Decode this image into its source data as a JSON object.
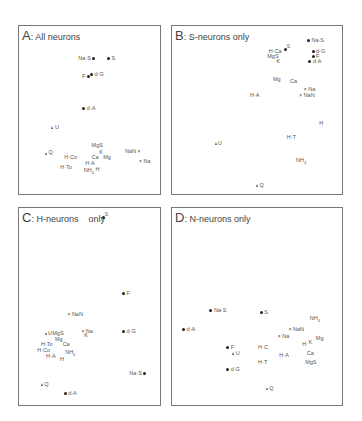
{
  "chart_data": [
    {
      "type": "scatter",
      "title": "A: All neurons",
      "letter": "A",
      "subtitle": "All neurons",
      "grid": false,
      "markers": {
        "filled_circle": "dot",
        "open_circle": "circle",
        "cross": "x",
        "triangle": "tri"
      },
      "points": [
        {
          "label": "Na·S",
          "x": 0.53,
          "y": 0.12,
          "marker": "dot",
          "lp": "left"
        },
        {
          "label": "S",
          "x": 0.65,
          "y": 0.12,
          "marker": "dot",
          "lp": "right"
        },
        {
          "label": "F",
          "x": 0.49,
          "y": 0.24,
          "marker": "dot",
          "lp": "left"
        },
        {
          "label": "d·G",
          "x": 0.52,
          "y": 0.23,
          "marker": "dot",
          "lp": "right"
        },
        {
          "label": "d·A",
          "x": 0.46,
          "y": 0.46,
          "marker": "dot",
          "lp": "right"
        },
        {
          "label": "U",
          "x": 0.22,
          "y": 0.59,
          "marker": "tri",
          "lp": "right"
        },
        {
          "label": "Q",
          "x": 0.17,
          "y": 0.76,
          "marker": "tri",
          "lp": "right"
        },
        {
          "label": "MgS",
          "x": 0.52,
          "y": 0.71,
          "marker": "circle",
          "lp": "right"
        },
        {
          "label": "K",
          "x": 0.58,
          "y": 0.76,
          "marker": "circle",
          "lp": "right"
        },
        {
          "label": "Ca",
          "x": 0.52,
          "y": 0.79,
          "marker": "circle",
          "lp": "right"
        },
        {
          "label": "Mg",
          "x": 0.61,
          "y": 0.79,
          "marker": "circle",
          "lp": "right"
        },
        {
          "label": "H·Co",
          "x": 0.4,
          "y": 0.79,
          "marker": "circle",
          "lp": "left"
        },
        {
          "label": "H·A",
          "x": 0.47,
          "y": 0.83,
          "marker": "circle",
          "lp": "right"
        },
        {
          "label": "H·To",
          "x": 0.36,
          "y": 0.86,
          "marker": "circle",
          "lp": "left"
        },
        {
          "label": "NH4",
          "x": 0.46,
          "y": 0.88,
          "marker": "circle",
          "lp": "right"
        },
        {
          "label": "H",
          "x": 0.55,
          "y": 0.87,
          "marker": "circle",
          "lp": "right"
        },
        {
          "label": "NaN",
          "x": 0.88,
          "y": 0.75,
          "marker": "x",
          "lp": "left"
        },
        {
          "label": "Na",
          "x": 0.9,
          "y": 0.82,
          "marker": "x",
          "lp": "right"
        }
      ]
    },
    {
      "type": "scatter",
      "title": "B: S-neurons only",
      "letter": "B",
      "subtitle": "S-neurons only",
      "grid": false,
      "points": [
        {
          "label": "Na·S",
          "x": 0.85,
          "y": 0.04,
          "marker": "dot",
          "lp": "right"
        },
        {
          "label": "S",
          "x": 0.7,
          "y": 0.08,
          "marker": "dot",
          "lp": "above"
        },
        {
          "label": "H·Ca",
          "x": 0.67,
          "y": 0.11,
          "marker": "circle",
          "lp": "left"
        },
        {
          "label": "d·G",
          "x": 0.88,
          "y": 0.11,
          "marker": "dot",
          "lp": "right"
        },
        {
          "label": "MgS",
          "x": 0.65,
          "y": 0.14,
          "marker": "circle",
          "lp": "left"
        },
        {
          "label": "F",
          "x": 0.88,
          "y": 0.14,
          "marker": "dot",
          "lp": "right"
        },
        {
          "label": "d·A",
          "x": 0.86,
          "y": 0.17,
          "marker": "dot",
          "lp": "right"
        },
        {
          "label": "K",
          "x": 0.66,
          "y": 0.17,
          "marker": "circle",
          "lp": "left"
        },
        {
          "label": "Mg",
          "x": 0.62,
          "y": 0.29,
          "marker": "circle",
          "lp": "right"
        },
        {
          "label": "Ca",
          "x": 0.73,
          "y": 0.3,
          "marker": "circle",
          "lp": "right"
        },
        {
          "label": "Na",
          "x": 0.83,
          "y": 0.35,
          "marker": "x",
          "lp": "right"
        },
        {
          "label": "NaN",
          "x": 0.8,
          "y": 0.39,
          "marker": "x",
          "lp": "right"
        },
        {
          "label": "H·A",
          "x": 0.47,
          "y": 0.39,
          "marker": "circle",
          "lp": "right"
        },
        {
          "label": "H",
          "x": 0.92,
          "y": 0.57,
          "marker": "circle",
          "lp": "right"
        },
        {
          "label": "H·T",
          "x": 0.71,
          "y": 0.66,
          "marker": "circle",
          "lp": "right"
        },
        {
          "label": "U",
          "x": 0.25,
          "y": 0.7,
          "marker": "tri",
          "lp": "right"
        },
        {
          "label": "NH4",
          "x": 0.77,
          "y": 0.81,
          "marker": "circle",
          "lp": "right"
        },
        {
          "label": "Q",
          "x": 0.52,
          "y": 0.97,
          "marker": "tri",
          "lp": "right"
        }
      ]
    },
    {
      "type": "scatter",
      "title": "C: H-neurons only",
      "letter": "C",
      "subtitle": "H-neurons",
      "subtitle_tail": "only",
      "grid": false,
      "points": [
        {
          "label": "S",
          "x": 0.62,
          "y": 0.02,
          "marker": "dot",
          "lp": "above"
        },
        {
          "label": "F",
          "x": 0.78,
          "y": 0.44,
          "marker": "dot",
          "lp": "right"
        },
        {
          "label": "NaN",
          "x": 0.35,
          "y": 0.55,
          "marker": "x",
          "lp": "right"
        },
        {
          "label": "d·G",
          "x": 0.78,
          "y": 0.64,
          "marker": "dot",
          "lp": "right"
        },
        {
          "label": "U",
          "x": 0.17,
          "y": 0.65,
          "marker": "tri",
          "lp": "right"
        },
        {
          "label": "MgS",
          "x": 0.3,
          "y": 0.65,
          "marker": "circle",
          "lp": "left"
        },
        {
          "label": "Na",
          "x": 0.46,
          "y": 0.64,
          "marker": "x",
          "lp": "right"
        },
        {
          "label": "K",
          "x": 0.47,
          "y": 0.66,
          "marker": "circle",
          "lp": "right"
        },
        {
          "label": "Mg",
          "x": 0.24,
          "y": 0.68,
          "marker": "circle",
          "lp": "right"
        },
        {
          "label": "H·To",
          "x": 0.13,
          "y": 0.71,
          "marker": "circle",
          "lp": "right"
        },
        {
          "label": "Ca",
          "x": 0.3,
          "y": 0.71,
          "marker": "circle",
          "lp": "right"
        },
        {
          "label": "H·Co",
          "x": 0.1,
          "y": 0.74,
          "marker": "circle",
          "lp": "right"
        },
        {
          "label": "NH4",
          "x": 0.32,
          "y": 0.75,
          "marker": "circle",
          "lp": "right"
        },
        {
          "label": "H·A",
          "x": 0.17,
          "y": 0.77,
          "marker": "circle",
          "lp": "right"
        },
        {
          "label": "H",
          "x": 0.28,
          "y": 0.79,
          "marker": "circle",
          "lp": "right"
        },
        {
          "label": "Na·S",
          "x": 0.94,
          "y": 0.86,
          "marker": "dot",
          "lp": "left"
        },
        {
          "label": "Q",
          "x": 0.14,
          "y": 0.92,
          "marker": "tri",
          "lp": "right"
        },
        {
          "label": "d·A",
          "x": 0.32,
          "y": 0.97,
          "marker": "dot",
          "lp": "right"
        }
      ]
    },
    {
      "type": "scatter",
      "title": "D: N-neurons only",
      "letter": "D",
      "subtitle": "N-neurons only",
      "grid": false,
      "points": [
        {
          "label": "Na·S",
          "x": 0.22,
          "y": 0.52,
          "marker": "dot",
          "lp": "right"
        },
        {
          "label": "S",
          "x": 0.55,
          "y": 0.53,
          "marker": "dot",
          "lp": "right"
        },
        {
          "label": "NH4",
          "x": 0.87,
          "y": 0.56,
          "marker": "circle",
          "lp": "right"
        },
        {
          "label": "d·A",
          "x": 0.04,
          "y": 0.62,
          "marker": "dot",
          "lp": "right"
        },
        {
          "label": "NaN",
          "x": 0.74,
          "y": 0.62,
          "marker": "x",
          "lp": "right"
        },
        {
          "label": "Na",
          "x": 0.67,
          "y": 0.66,
          "marker": "x",
          "lp": "right"
        },
        {
          "label": "Mg",
          "x": 0.91,
          "y": 0.67,
          "marker": "circle",
          "lp": "right"
        },
        {
          "label": "K",
          "x": 0.88,
          "y": 0.69,
          "marker": "circle",
          "lp": "left"
        },
        {
          "label": "H",
          "x": 0.84,
          "y": 0.7,
          "marker": "circle",
          "lp": "left"
        },
        {
          "label": "F",
          "x": 0.33,
          "y": 0.72,
          "marker": "dot",
          "lp": "right"
        },
        {
          "label": "H·C",
          "x": 0.53,
          "y": 0.72,
          "marker": "circle",
          "lp": "right"
        },
        {
          "label": "U",
          "x": 0.37,
          "y": 0.75,
          "marker": "tri",
          "lp": "right"
        },
        {
          "label": "H·A",
          "x": 0.67,
          "y": 0.76,
          "marker": "circle",
          "lp": "right"
        },
        {
          "label": "Ca",
          "x": 0.85,
          "y": 0.75,
          "marker": "circle",
          "lp": "right"
        },
        {
          "label": "H·T",
          "x": 0.53,
          "y": 0.8,
          "marker": "circle",
          "lp": "right"
        },
        {
          "label": "MgS",
          "x": 0.84,
          "y": 0.8,
          "marker": "circle",
          "lp": "right"
        },
        {
          "label": "d·G",
          "x": 0.33,
          "y": 0.84,
          "marker": "dot",
          "lp": "right"
        },
        {
          "label": "Q",
          "x": 0.59,
          "y": 0.94,
          "marker": "tri",
          "lp": "right"
        }
      ]
    }
  ],
  "panels": [
    {
      "id": "A",
      "letter": "A",
      "sep": ": ",
      "caption": "All neurons"
    },
    {
      "id": "B",
      "letter": "B",
      "sep": ": ",
      "caption": "S-neurons only"
    },
    {
      "id": "C",
      "letter": "C",
      "sep": ": ",
      "caption": "H-neurons",
      "tail": "only"
    },
    {
      "id": "D",
      "letter": "D",
      "sep": ": ",
      "caption": "N-neurons only"
    }
  ]
}
